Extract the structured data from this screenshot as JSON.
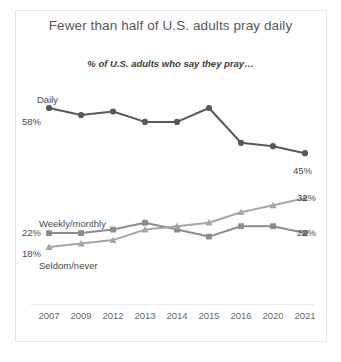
{
  "chart_data": {
    "type": "line",
    "title": "Fewer than half of U.S. adults pray daily",
    "subtitle": "% of U.S. adults who say they pray…",
    "xlabel": "",
    "ylabel": "",
    "grid": false,
    "legend_position": "inline-labels",
    "ylim": [
      0,
      70
    ],
    "categories": [
      "2007",
      "2009",
      "2012",
      "2013",
      "2014",
      "2015",
      "2016",
      "2020",
      "2021"
    ],
    "series": [
      {
        "name": "Daily",
        "marker": "circle",
        "color": "#595959",
        "values": [
          58,
          56,
          57,
          54,
          54,
          58,
          48,
          47,
          45
        ],
        "start_label": "58%",
        "end_label": "45%"
      },
      {
        "name": "Weekly/monthly",
        "marker": "square",
        "color": "#8c8c8c",
        "values": [
          22,
          22,
          23,
          25,
          23,
          21,
          24,
          24,
          22
        ],
        "start_label": "22%",
        "end_label": "22%"
      },
      {
        "name": "Seldom/never",
        "marker": "triangle",
        "color": "#a6a6a6",
        "values": [
          18,
          19,
          20,
          23,
          24,
          25,
          28,
          30,
          32
        ],
        "start_label": "18%",
        "end_label": "32%"
      }
    ]
  },
  "labels": {
    "daily_name": "Daily",
    "daily_left": "58%",
    "daily_right": "45%",
    "weekly_name": "Weekly/monthly",
    "weekly_left": "22%",
    "weekly_right": "22%",
    "seldom_name": "Seldom/never",
    "seldom_left": "18%",
    "seldom_right": "32%"
  }
}
